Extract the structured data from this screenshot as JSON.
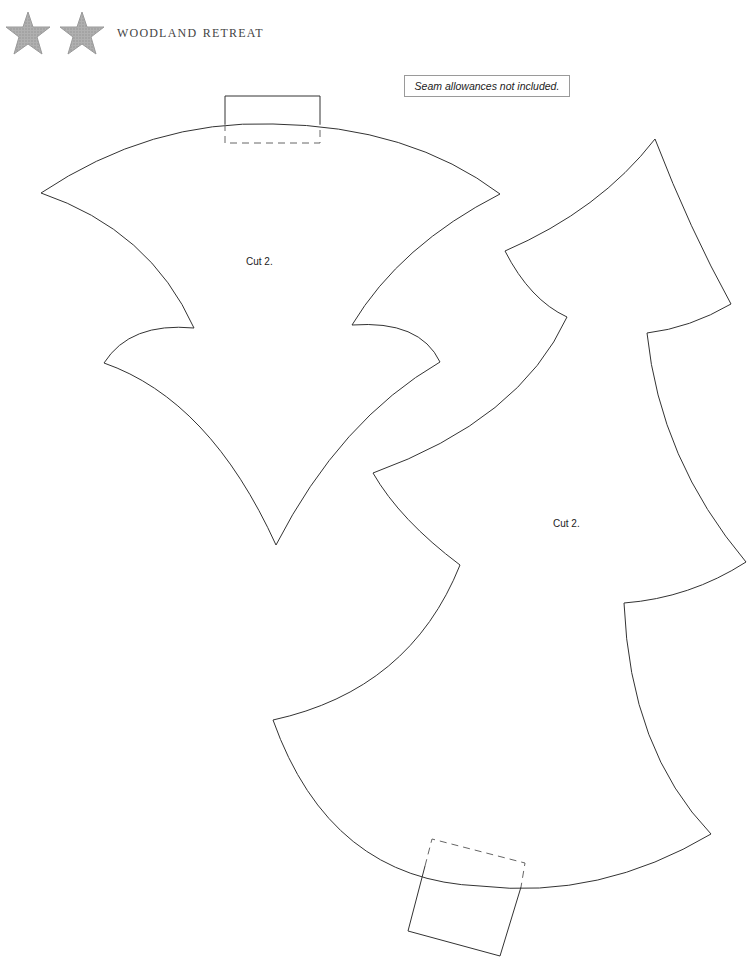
{
  "header": {
    "brand": "Woodland Retreat",
    "icons": [
      "star-icon",
      "star-icon"
    ],
    "star_color": "#a8a8a8"
  },
  "note": {
    "text": "Seam allowances not included."
  },
  "pieces": [
    {
      "name": "ornament-star-piece",
      "instruction": "Cut 2."
    },
    {
      "name": "tree-piece",
      "instruction": "Cut 2."
    }
  ],
  "colors": {
    "outline": "#333333",
    "dashed": "#666666"
  }
}
